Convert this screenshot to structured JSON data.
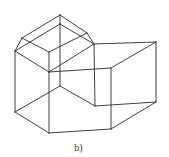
{
  "figure": {
    "caption": "b)",
    "stroke_color": "#2a2a2a",
    "vertices": {
      "apex": [
        60,
        15
      ],
      "inner_apex": [
        60,
        24
      ],
      "left_bevel": [
        22,
        38
      ],
      "left": [
        15,
        51
      ],
      "right_bevel": [
        87,
        33
      ],
      "right_top": [
        94,
        44
      ],
      "front_inner": [
        49,
        52
      ],
      "front": [
        49,
        72
      ],
      "core_bottom": [
        60,
        86
      ],
      "notch_corner": [
        111,
        68
      ],
      "far_right_top": [
        156,
        42
      ],
      "far_right_bottom": [
        156,
        102
      ],
      "notch_bottom": [
        95,
        106
      ],
      "notch_mid": [
        111,
        104
      ],
      "left_bottom": [
        15,
        112
      ],
      "front_bottom": [
        49,
        133
      ],
      "right_bottom": [
        111,
        129
      ]
    },
    "edges": [
      [
        "apex",
        "left_bevel"
      ],
      [
        "apex",
        "right_bevel"
      ],
      [
        "apex",
        "inner_apex"
      ],
      [
        "left_bevel",
        "left"
      ],
      [
        "right_bevel",
        "right_top"
      ],
      [
        "inner_apex",
        "left"
      ],
      [
        "inner_apex",
        "right_top"
      ],
      [
        "left_bevel",
        "front_inner"
      ],
      [
        "right_bevel",
        "front_inner"
      ],
      [
        "left",
        "front"
      ],
      [
        "front_inner",
        "front"
      ],
      [
        "front",
        "right_top"
      ],
      [
        "inner_apex",
        "core_bottom"
      ],
      [
        "front",
        "notch_corner"
      ],
      [
        "right_top",
        "far_right_top"
      ],
      [
        "notch_corner",
        "far_right_top"
      ],
      [
        "far_right_top",
        "far_right_bottom"
      ],
      [
        "right_top",
        "notch_bottom"
      ],
      [
        "notch_corner",
        "right_bottom"
      ],
      [
        "core_bottom",
        "notch_bottom"
      ],
      [
        "core_bottom",
        "left_bottom"
      ],
      [
        "notch_bottom",
        "far_right_bottom"
      ],
      [
        "left",
        "left_bottom"
      ],
      [
        "front",
        "front_bottom"
      ],
      [
        "left_bottom",
        "front_bottom"
      ],
      [
        "front_bottom",
        "right_bottom"
      ],
      [
        "right_bottom",
        "far_right_bottom"
      ]
    ]
  }
}
